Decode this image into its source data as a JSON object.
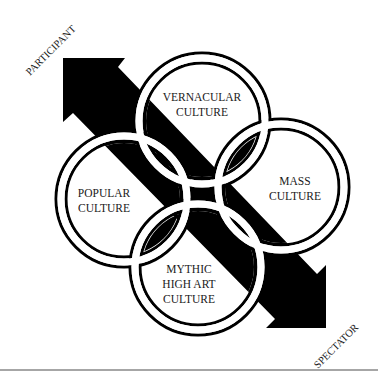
{
  "diagram": {
    "axis": {
      "start_label": "PARTICIPANT",
      "end_label": "SPECTATOR",
      "direction": "bidirectional"
    },
    "circles": [
      {
        "id": "vernacular",
        "lines": [
          "VERNACULAR",
          "CULTURE"
        ]
      },
      {
        "id": "popular",
        "lines": [
          "POPULAR",
          "CULTURE"
        ]
      },
      {
        "id": "mass",
        "lines": [
          "MASS",
          "CULTURE"
        ]
      },
      {
        "id": "mythic",
        "lines": [
          "MYTHIC",
          "HIGH ART",
          "CULTURE"
        ]
      }
    ],
    "colors": {
      "ink": "#000000",
      "background": "#ffffff",
      "rule": "#888888"
    }
  }
}
